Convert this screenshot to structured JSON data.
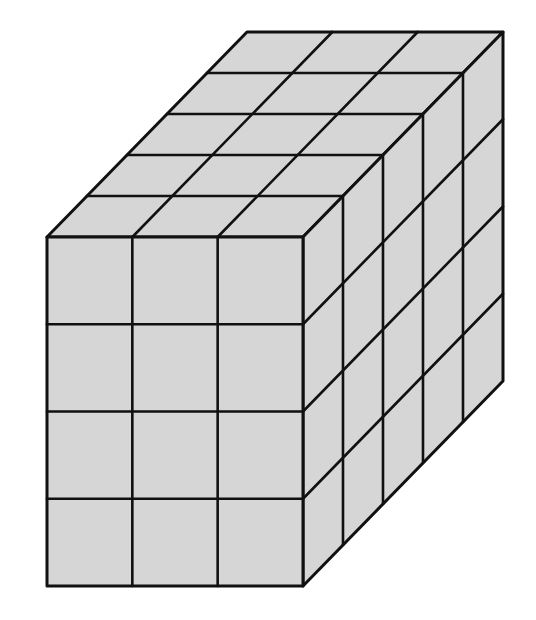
{
  "figure": {
    "dimensions": {
      "width_cubes": 3,
      "height_cubes": 4,
      "depth_cubes": 5
    },
    "total_cubes": 60,
    "colors": {
      "face_fill": "#d6d6d6",
      "edge_stroke": "#111111",
      "background": "#ffffff"
    },
    "geometry": {
      "front_left": 47,
      "front_top": 237,
      "cell_w": 85.33,
      "cell_h": 87.25,
      "depth_dx": 40,
      "depth_dy": -41
    }
  }
}
